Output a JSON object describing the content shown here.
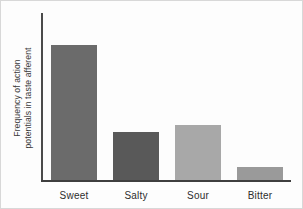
{
  "chart_data": {
    "type": "bar",
    "title": "",
    "xlabel": "",
    "ylabel": "Frequency of action potentials in taste afferent",
    "ylabel_line1": "Frequency of action",
    "ylabel_line2": "potentials in taste afferent",
    "categories": [
      "Sweet",
      "Salty",
      "Sour",
      "Bitter"
    ],
    "values": [
      0.81,
      0.29,
      0.33,
      0.08
    ],
    "value_unit": "relative (arbitrary units, axis unlabeled)",
    "ylim": [
      0,
      1
    ],
    "grid": false,
    "legend": null,
    "axis_ticks": {
      "x": [
        "Sweet",
        "Salty",
        "Sour",
        "Bitter"
      ],
      "y": []
    },
    "bar_colors": [
      "#6b6b6b",
      "#595959",
      "#a8a8a8",
      "#9a9a9a"
    ],
    "bars": [
      {
        "label": "Sweet",
        "value": 0.81,
        "color": "#6b6b6b"
      },
      {
        "label": "Salty",
        "value": 0.29,
        "color": "#595959"
      },
      {
        "label": "Sour",
        "value": 0.33,
        "color": "#a8a8a8"
      },
      {
        "label": "Bitter",
        "value": 0.08,
        "color": "#9a9a9a"
      }
    ],
    "colors": {
      "axis": "#3f3f3f",
      "text": "#2e2e2e",
      "background": "#fdfdfd"
    }
  }
}
